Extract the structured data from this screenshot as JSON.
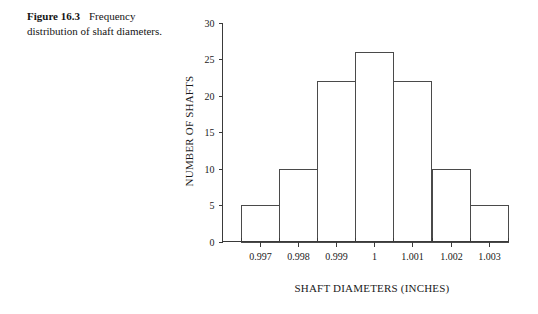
{
  "caption": {
    "figure_number": "Figure 16.3",
    "text": "Frequency distribution of shaft diameters."
  },
  "chart_data": {
    "type": "bar",
    "title": "",
    "subtitle": "",
    "xlabel": "SHAFT DIAMETERS (INCHES)",
    "ylabel": "NUMBER OF SHAFTS",
    "categories": [
      "0.997",
      "0.998",
      "0.999",
      "1",
      "1.001",
      "1.002",
      "1.003"
    ],
    "values": [
      5,
      10,
      22,
      26,
      22,
      10,
      5
    ],
    "ylim": [
      0,
      30
    ],
    "yticks": [
      0,
      5,
      10,
      15,
      20,
      25,
      30
    ],
    "ytick_labels": [
      "0",
      "5",
      "10",
      "15",
      "20",
      "25",
      "30"
    ],
    "xtick_labels": [
      "0.997",
      "0.998",
      "0.999",
      "1",
      "1.001",
      "1.002",
      "1.003"
    ],
    "grid": false,
    "legend": false,
    "legend_position": "none",
    "bar_fill_color": "#ffffff",
    "bar_edge_color": "#4a4a4a",
    "axis_color": "#3a3a3a",
    "background_color": "#ffffff"
  }
}
